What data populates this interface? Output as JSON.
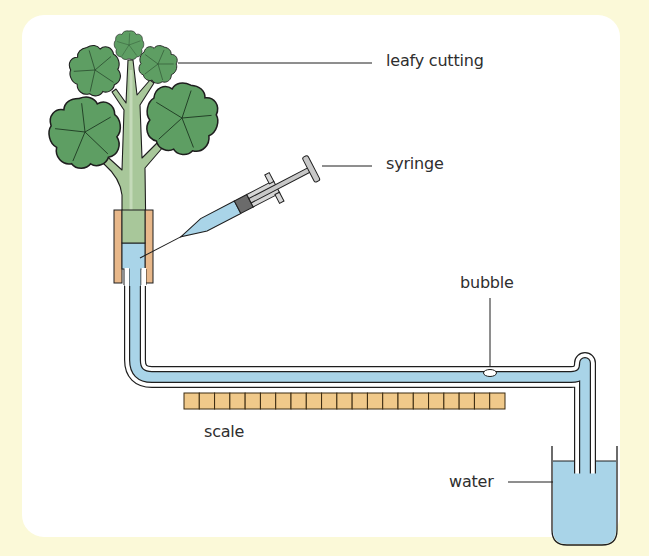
{
  "diagram": {
    "labels": {
      "leafy_cutting": "leafy cutting",
      "syringe": "syringe",
      "bubble": "bubble",
      "scale": "scale",
      "water": "water"
    },
    "scale_segments": 21,
    "colors": {
      "page_background": "#fbf9d8",
      "card_background": "#ffffff",
      "leaf_green": "#5e9e63",
      "stem_green": "#a8c79a",
      "water_blue": "#a9d4e8",
      "rubber_tubing": "#e8b88a",
      "scale_fill": "#f0c98a",
      "syringe_grey": "#c8c8c8",
      "plunger_seal": "#6b6b6b",
      "outline": "#1e1e1e"
    }
  }
}
